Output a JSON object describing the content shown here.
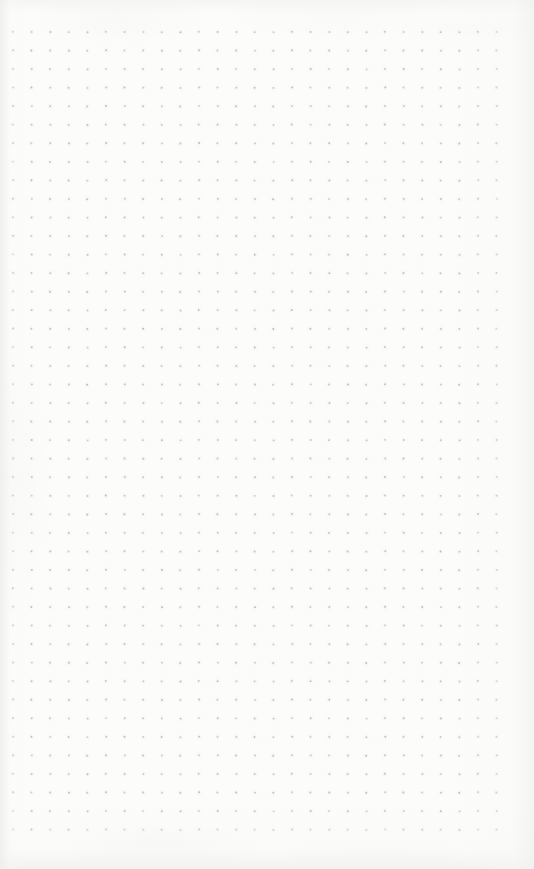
{
  "image": {
    "subject": "dot-grid-notebook-page",
    "description": "Blank scanned bullet-journal dot grid paper",
    "width": 534,
    "height": 869,
    "orientation": "portrait"
  },
  "paper": {
    "background_color": "#fcfcfb",
    "edge_shadow_color": "#eeeeec",
    "texture_opacity": 0.55
  },
  "grid": {
    "type": "dot-grid",
    "dot_color": "#b9b9c2",
    "halo_color": "#f4f4f6",
    "dot_radius": 0.95,
    "halo_radius": 2.6,
    "spacing_x": 18.6,
    "spacing_y": 18.55,
    "origin_x": 13,
    "origin_y": 32,
    "columns": 27,
    "rows": 44
  },
  "margins": {
    "top": 32,
    "left": 13,
    "right": 38,
    "bottom": 42
  },
  "content": {
    "text_present": false,
    "handwriting_present": false,
    "annotations": []
  }
}
